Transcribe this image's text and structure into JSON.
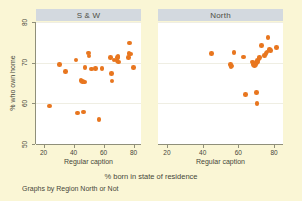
{
  "figure": {
    "ylabel": "% who own home",
    "xtitle": "% born in state of residence",
    "note": "Graphs by Region North or Not",
    "marker_color": "#e8761f",
    "background_color": "#faf6d5",
    "panel_background": "#ffffff",
    "panel_header_color": "#d3d9df"
  },
  "chart_data": {
    "type": "scatter",
    "title": "",
    "xlabel": "% born in state of residence",
    "ylabel": "% who own home",
    "xlim": [
      15,
      85
    ],
    "ylim": [
      50,
      80
    ],
    "xticks": [
      20,
      40,
      60,
      80
    ],
    "yticks": [
      50,
      60,
      70,
      80
    ],
    "grid": true,
    "legend": "none",
    "panels": [
      {
        "label": "S & W",
        "caption": "Regular caption",
        "xticks": [
          20,
          40,
          60,
          80
        ],
        "points": [
          {
            "x": 24.0,
            "y": 59.3
          },
          {
            "x": 30.5,
            "y": 69.6
          },
          {
            "x": 34.5,
            "y": 67.8
          },
          {
            "x": 41.8,
            "y": 70.7
          },
          {
            "x": 42.5,
            "y": 57.6
          },
          {
            "x": 45.0,
            "y": 65.6
          },
          {
            "x": 46.0,
            "y": 65.3
          },
          {
            "x": 46.5,
            "y": 57.9
          },
          {
            "x": 47.2,
            "y": 65.2
          },
          {
            "x": 47.6,
            "y": 68.8
          },
          {
            "x": 50.0,
            "y": 72.4
          },
          {
            "x": 50.4,
            "y": 71.6
          },
          {
            "x": 52.0,
            "y": 68.4
          },
          {
            "x": 54.5,
            "y": 68.6
          },
          {
            "x": 57.0,
            "y": 56.0
          },
          {
            "x": 59.0,
            "y": 68.5
          },
          {
            "x": 64.5,
            "y": 71.3
          },
          {
            "x": 65.5,
            "y": 67.3
          },
          {
            "x": 65.8,
            "y": 65.5
          },
          {
            "x": 67.0,
            "y": 70.7
          },
          {
            "x": 69.0,
            "y": 70.6
          },
          {
            "x": 69.4,
            "y": 71.2
          },
          {
            "x": 69.8,
            "y": 71.5
          },
          {
            "x": 70.0,
            "y": 70.2
          },
          {
            "x": 76.5,
            "y": 71.2
          },
          {
            "x": 77.0,
            "y": 72.2
          },
          {
            "x": 77.5,
            "y": 74.8
          },
          {
            "x": 78.0,
            "y": 72.1
          },
          {
            "x": 80.0,
            "y": 68.8
          }
        ]
      },
      {
        "label": "North",
        "caption": "Regular caption",
        "xticks": [
          20,
          40,
          60,
          80
        ],
        "points": [
          {
            "x": 45.0,
            "y": 72.2
          },
          {
            "x": 55.5,
            "y": 69.6
          },
          {
            "x": 55.8,
            "y": 68.9
          },
          {
            "x": 56.2,
            "y": 69.2
          },
          {
            "x": 57.5,
            "y": 72.5
          },
          {
            "x": 63.0,
            "y": 71.4
          },
          {
            "x": 64.0,
            "y": 62.2
          },
          {
            "x": 68.0,
            "y": 70.2
          },
          {
            "x": 68.5,
            "y": 69.6
          },
          {
            "x": 69.0,
            "y": 69.3
          },
          {
            "x": 69.5,
            "y": 69.6
          },
          {
            "x": 70.0,
            "y": 62.6
          },
          {
            "x": 70.2,
            "y": 70.0
          },
          {
            "x": 70.5,
            "y": 60.0
          },
          {
            "x": 70.8,
            "y": 70.6
          },
          {
            "x": 71.0,
            "y": 70.2
          },
          {
            "x": 71.5,
            "y": 71.0
          },
          {
            "x": 72.0,
            "y": 71.3
          },
          {
            "x": 73.0,
            "y": 74.2
          },
          {
            "x": 74.5,
            "y": 71.8
          },
          {
            "x": 75.5,
            "y": 72.3
          },
          {
            "x": 76.0,
            "y": 72.6
          },
          {
            "x": 76.5,
            "y": 76.2
          },
          {
            "x": 77.5,
            "y": 73.2
          },
          {
            "x": 78.0,
            "y": 73.0
          },
          {
            "x": 81.5,
            "y": 73.8
          }
        ]
      }
    ]
  }
}
